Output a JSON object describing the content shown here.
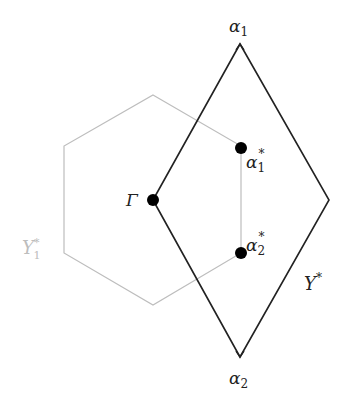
{
  "diagram": {
    "colors": {
      "background": "#ffffff",
      "rhombus_stroke": "#222222",
      "hexagon_stroke": "#bdbdbd",
      "point_fill": "#000000",
      "label": "#222222",
      "hexagon_label": "#bdbdbd"
    },
    "hexagon": {
      "name": "Y1*",
      "points": [
        [
          153,
          95
        ],
        [
          241,
          146
        ],
        [
          241,
          253
        ],
        [
          153,
          305
        ],
        [
          64,
          253
        ],
        [
          64,
          146
        ]
      ]
    },
    "rhombus": {
      "name": "Y*",
      "points": [
        [
          240,
          44
        ],
        [
          329,
          200
        ],
        [
          240,
          357
        ],
        [
          153,
          200
        ]
      ]
    },
    "points": [
      {
        "id": "gamma",
        "x": 153,
        "y": 200
      },
      {
        "id": "alpha1_star",
        "x": 241,
        "y": 148
      },
      {
        "id": "alpha2_star",
        "x": 241,
        "y": 253
      }
    ],
    "labels": {
      "alpha1": {
        "base": "α",
        "sub": "1",
        "sup": ""
      },
      "alpha2": {
        "base": "α",
        "sub": "2",
        "sup": ""
      },
      "alpha1_star": {
        "base": "α",
        "sub": "1",
        "sup": "*"
      },
      "alpha2_star": {
        "base": "α",
        "sub": "2",
        "sup": "*"
      },
      "gamma": {
        "base": "Γ"
      },
      "y_star": {
        "base": "Y",
        "sup": "*"
      },
      "y1_star": {
        "base": "Y",
        "sub": "1",
        "sup": "*"
      }
    }
  }
}
